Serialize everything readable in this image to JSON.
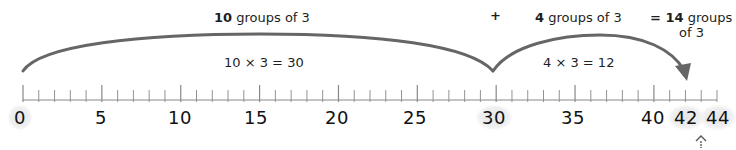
{
  "diagram": {
    "type": "number-line-jumps",
    "number_line": {
      "min": 0,
      "max": 44,
      "step": 1,
      "major_every": 5
    },
    "tick_labels": [
      "0",
      "5",
      "10",
      "15",
      "20",
      "25",
      "30",
      "35",
      "40",
      "42",
      "44"
    ],
    "highlighted_labels": [
      "0",
      "30",
      "42",
      "44"
    ],
    "jumps": [
      {
        "from": 0,
        "to": 30,
        "top_label_bold": "10",
        "top_label_rest": " groups of 3",
        "equation": "10 × 3 = 30"
      },
      {
        "from": 30,
        "to": 42,
        "top_label_bold": "4",
        "top_label_rest": " groups of 3",
        "equation": "4 × 3  = 12"
      }
    ],
    "plus_sign": "+",
    "result": {
      "prefix": "= ",
      "bold": "14",
      "line1_rest": " groups",
      "line2": "of 3"
    },
    "colors": {
      "arc": "#666666",
      "ticks": "#888888",
      "text": "#1e1e1e",
      "highlight": "#e8e8e8"
    },
    "icons": {
      "bottom_marker": "dotted-up-chevron-icon"
    }
  }
}
